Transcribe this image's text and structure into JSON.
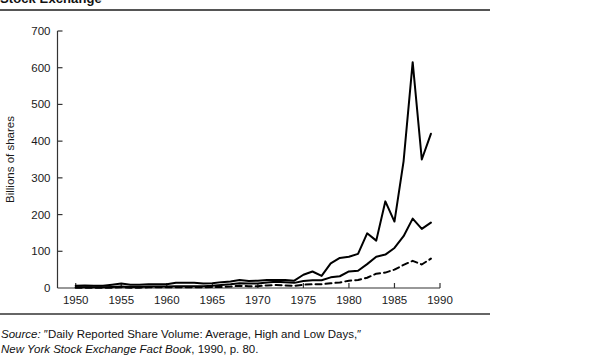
{
  "figure": {
    "title": "Stock Exchange",
    "source_prefix": "Source:",
    "source_quote": "″Daily Reported Share Volume: Average, High and Low Days,″",
    "source_book": "New York Stock Exchange Fact Book",
    "source_tail": ", 1990, p. 80."
  },
  "chart_data": {
    "type": "line",
    "title": "Stock Exchange",
    "xlabel": "",
    "ylabel": "Billions of shares",
    "xlim": [
      1948,
      1990
    ],
    "ylim": [
      0,
      700
    ],
    "grid": false,
    "legend_position": "none",
    "x_ticks": [
      1950,
      1955,
      1960,
      1965,
      1970,
      1975,
      1980,
      1985,
      1990
    ],
    "x_tick_labels": [
      "1950",
      "1955",
      "1960",
      "1965",
      "1970",
      "1975",
      "1980",
      "1985",
      "1990"
    ],
    "y_ticks": [
      0,
      100,
      200,
      300,
      400,
      500,
      600,
      700
    ],
    "y_tick_labels": [
      "0",
      "100",
      "200",
      "300",
      "400",
      "500",
      "600",
      "700"
    ],
    "y_origin_label": "0",
    "x": [
      1950,
      1951,
      1952,
      1953,
      1954,
      1955,
      1956,
      1957,
      1958,
      1959,
      1960,
      1961,
      1962,
      1963,
      1964,
      1965,
      1966,
      1967,
      1968,
      1969,
      1970,
      1971,
      1972,
      1973,
      1974,
      1975,
      1976,
      1977,
      1978,
      1979,
      1980,
      1981,
      1982,
      1983,
      1984,
      1985,
      1986,
      1987,
      1988,
      1989
    ],
    "series": [
      {
        "name": "High day",
        "style": "solid",
        "width": 2.0,
        "color": "#000000",
        "values": [
          6,
          7,
          6,
          6,
          9,
          12,
          9,
          9,
          10,
          10,
          10,
          14,
          14,
          14,
          12,
          13,
          16,
          18,
          22,
          19,
          20,
          22,
          22,
          22,
          20,
          36,
          45,
          33,
          67,
          82,
          85,
          93,
          149,
          129,
          236,
          181,
          345,
          615,
          350,
          420
        ]
      },
      {
        "name": "Average day",
        "style": "solid",
        "width": 2.0,
        "color": "#000000",
        "values": [
          2,
          2,
          2,
          2,
          3,
          4,
          3,
          3,
          4,
          4,
          4,
          5,
          5,
          5,
          5,
          6,
          8,
          10,
          13,
          12,
          12,
          15,
          17,
          16,
          14,
          19,
          21,
          21,
          29,
          32,
          45,
          47,
          65,
          85,
          91,
          109,
          141,
          189,
          161,
          178
        ]
      },
      {
        "name": "Low day",
        "style": "dashed",
        "width": 2.0,
        "color": "#000000",
        "values": [
          1,
          1,
          1,
          1,
          1,
          2,
          1,
          1,
          2,
          2,
          2,
          2,
          2,
          2,
          2,
          3,
          3,
          4,
          6,
          5,
          5,
          7,
          8,
          7,
          6,
          9,
          10,
          10,
          13,
          15,
          20,
          22,
          28,
          39,
          42,
          50,
          63,
          74,
          64,
          80
        ]
      }
    ]
  }
}
